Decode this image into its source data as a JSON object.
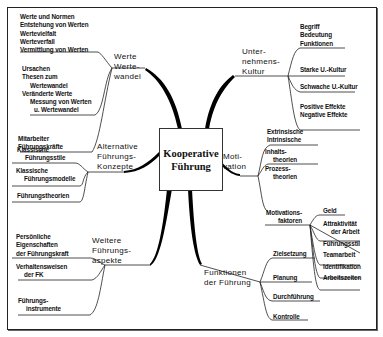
{
  "center": {
    "line1": "Kooperative",
    "line2": "Führung"
  },
  "branches": {
    "werte": {
      "label": [
        "Werte",
        "Werte-",
        "wandel"
      ],
      "groups": [
        [
          "Werte und Normen",
          "Entstehung von Werten",
          "Wertevielfalt",
          "Werteverfall",
          "Vermittlung von Werten"
        ],
        [
          "Ursachen",
          "Thesen zum",
          "Wertewandel",
          "Veränderte Werte",
          "Messung von Werten",
          "u. Wertewandel"
        ],
        [
          "Mitarbeiter",
          "Führungskräfte"
        ]
      ]
    },
    "kultur": {
      "label": [
        "Unter-",
        "nehmens-",
        "Kultur"
      ],
      "groups": [
        [
          "Begriff",
          "Bedeutung",
          "Funktionen"
        ],
        [
          "Starke U.-Kultur"
        ],
        [
          "Schwache U.-Kultur"
        ],
        [
          "Positive Effekte",
          "Negative Effekte"
        ]
      ]
    },
    "alternative": {
      "label": [
        "Alternative",
        "Führungs-",
        "Konzepte"
      ],
      "groups": [
        [
          "Klassische",
          "Führungsstile"
        ],
        [
          "Klassische",
          "Führungsmodelle"
        ],
        [
          "Führungstheorien"
        ]
      ]
    },
    "motivation": {
      "label": [
        "Moti-",
        "vation"
      ],
      "groups": [
        [
          "Extrinsische",
          "Intrinsische"
        ],
        [
          "Inhalts-",
          "theorien",
          "Prozess-",
          "theorien"
        ]
      ],
      "sub": {
        "label": [
          "Motivations-",
          "faktoren"
        ],
        "items": [
          "Geld",
          "Attraktivität",
          "der Arbeit",
          "Führungsstil",
          "Teamarbeit",
          "Identifikation",
          "Arbeitszeiten"
        ]
      }
    },
    "weitere": {
      "label": [
        "Weitere",
        "Führungs-",
        "aspekte"
      ],
      "groups": [
        [
          "Persönliche",
          "Eigenschaften",
          "der Führungskraft"
        ],
        [
          "Verhaltensweisen",
          "der FK"
        ],
        [
          "Führungs-",
          "instrumente"
        ]
      ]
    },
    "funktionen": {
      "label": [
        "Funktionen",
        "der Führung"
      ],
      "items": [
        "Zielsetzung",
        "Planung",
        "Durchführung",
        "Kontrolle"
      ]
    }
  }
}
